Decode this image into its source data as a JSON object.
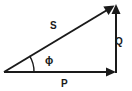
{
  "diagram": {
    "type": "power-triangle",
    "background_color": "#ffffff",
    "stroke_color": "#1a1a1a",
    "labels": {
      "hypotenuse": "S",
      "vertical": "Q",
      "horizontal": "P",
      "angle": "ϕ"
    },
    "vectors": [
      {
        "name": "S",
        "label": "S",
        "from": [
          4,
          72
        ],
        "to": [
          115,
          5
        ],
        "arrowhead": true,
        "description": "hypotenuse vector from origin to apex"
      },
      {
        "name": "Q",
        "label": "Q",
        "from": [
          116,
          72
        ],
        "to": [
          116,
          5
        ],
        "arrowhead": true,
        "description": "vertical vector upward at right side"
      },
      {
        "name": "P",
        "label": "P",
        "from": [
          4,
          72
        ],
        "to": [
          116,
          72
        ],
        "arrowhead": true,
        "description": "horizontal baseline vector to the right"
      }
    ],
    "angle_arc": {
      "name": "phi",
      "label": "ϕ",
      "vertex": [
        4,
        72
      ],
      "radius": 30
    }
  }
}
